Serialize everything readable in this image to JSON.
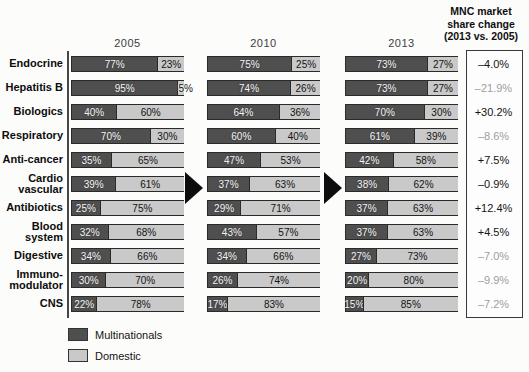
{
  "columns": [
    "2005",
    "2010",
    "2013"
  ],
  "change_header": "MNC market\nshare change\n(2013 vs. 2005)",
  "legend": {
    "mnc": "Multinationals",
    "dom": "Domestic"
  },
  "colors": {
    "multinationals": "#4f4f4f",
    "domestic": "#c9c9c9",
    "change_normal": "#141414",
    "change_muted": "#9e9e9e"
  },
  "rows": [
    {
      "label": "Endocrine",
      "v2005": [
        77,
        23
      ],
      "v2010": [
        75,
        25
      ],
      "v2013": [
        73,
        27
      ],
      "change": "–4.0%",
      "muted": false
    },
    {
      "label": "Hepatitis B",
      "v2005": [
        95,
        5
      ],
      "v2010": [
        74,
        26
      ],
      "v2013": [
        73,
        27
      ],
      "change": "–21.9%",
      "muted": true
    },
    {
      "label": "Biologics",
      "v2005": [
        40,
        60
      ],
      "v2010": [
        64,
        36
      ],
      "v2013": [
        70,
        30
      ],
      "change": "+30.2%",
      "muted": false
    },
    {
      "label": "Respiratory",
      "v2005": [
        70,
        30
      ],
      "v2010": [
        60,
        40
      ],
      "v2013": [
        61,
        39
      ],
      "change": "–8.6%",
      "muted": true
    },
    {
      "label": "Anti-cancer",
      "v2005": [
        35,
        65
      ],
      "v2010": [
        47,
        53
      ],
      "v2013": [
        42,
        58
      ],
      "change": "+7.5%",
      "muted": false
    },
    {
      "label": "Cardio\nvascular",
      "v2005": [
        39,
        61
      ],
      "v2010": [
        37,
        63
      ],
      "v2013": [
        38,
        62
      ],
      "change": "–0.9%",
      "muted": false
    },
    {
      "label": "Antibiotics",
      "v2005": [
        25,
        75
      ],
      "v2010": [
        29,
        71
      ],
      "v2013": [
        37,
        63
      ],
      "change": "+12.4%",
      "muted": false
    },
    {
      "label": "Blood\nsystem",
      "v2005": [
        32,
        68
      ],
      "v2010": [
        43,
        57
      ],
      "v2013": [
        37,
        63
      ],
      "change": "+4.5%",
      "muted": false
    },
    {
      "label": "Digestive",
      "v2005": [
        34,
        66
      ],
      "v2010": [
        34,
        66
      ],
      "v2013": [
        27,
        73
      ],
      "change": "–7.0%",
      "muted": true
    },
    {
      "label": "Immuno-\nmodulator",
      "v2005": [
        30,
        70
      ],
      "v2010": [
        26,
        74
      ],
      "v2013": [
        20,
        80
      ],
      "change": "–9.9%",
      "muted": true
    },
    {
      "label": "CNS",
      "v2005": [
        22,
        78
      ],
      "v2010": [
        17,
        83
      ],
      "v2013": [
        15,
        85
      ],
      "change": "–7.2%",
      "muted": true
    }
  ],
  "chart_data": {
    "type": "bar",
    "subtype": "horizontal-stacked-100percent",
    "categories": [
      "Endocrine",
      "Hepatitis B",
      "Biologics",
      "Respiratory",
      "Anti-cancer",
      "Cardio vascular",
      "Antibiotics",
      "Blood system",
      "Digestive",
      "Immuno-modulator",
      "CNS"
    ],
    "groups": [
      "2005",
      "2010",
      "2013"
    ],
    "series": [
      {
        "name": "Multinationals",
        "group": "2005",
        "values": [
          77,
          95,
          40,
          70,
          35,
          39,
          25,
          32,
          34,
          30,
          22
        ]
      },
      {
        "name": "Domestic",
        "group": "2005",
        "values": [
          23,
          5,
          60,
          30,
          65,
          61,
          75,
          68,
          66,
          70,
          78
        ]
      },
      {
        "name": "Multinationals",
        "group": "2010",
        "values": [
          75,
          74,
          64,
          60,
          47,
          37,
          29,
          43,
          34,
          26,
          17
        ]
      },
      {
        "name": "Domestic",
        "group": "2010",
        "values": [
          25,
          26,
          36,
          40,
          53,
          63,
          71,
          57,
          66,
          74,
          83
        ]
      },
      {
        "name": "Multinationals",
        "group": "2013",
        "values": [
          73,
          73,
          70,
          61,
          42,
          38,
          37,
          37,
          27,
          20,
          15
        ]
      },
      {
        "name": "Domestic",
        "group": "2013",
        "values": [
          27,
          27,
          30,
          39,
          58,
          62,
          63,
          63,
          73,
          80,
          85
        ]
      }
    ],
    "annotations": {
      "mnc_share_change_2013_vs_2005": [
        "-4.0%",
        "-21.9%",
        "+30.2%",
        "-8.6%",
        "+7.5%",
        "-0.9%",
        "+12.4%",
        "+4.5%",
        "-7.0%",
        "-9.9%",
        "-7.2%"
      ]
    },
    "legend_entries": [
      "Multinationals",
      "Domestic"
    ],
    "legend_position": "bottom-left",
    "value_labels": "percent-inside-segments",
    "xlim": [
      0,
      100
    ],
    "grid": false
  }
}
